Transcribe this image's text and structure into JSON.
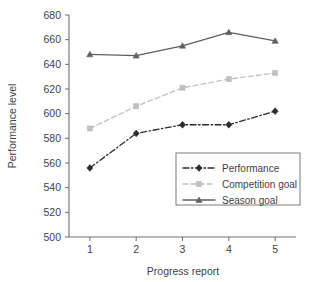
{
  "chart_data": {
    "type": "line",
    "title": "",
    "xlabel": "Progress report",
    "ylabel": "Performance level",
    "categories": [
      "1",
      "2",
      "3",
      "4",
      "5"
    ],
    "x": [
      1,
      2,
      3,
      4,
      5
    ],
    "xlim": [
      0.55,
      5.45
    ],
    "ylim": [
      500,
      680
    ],
    "ytick_labels": [
      "500",
      "520",
      "540",
      "560",
      "580",
      "600",
      "620",
      "640",
      "660",
      "680"
    ],
    "yticks": [
      500,
      520,
      540,
      560,
      580,
      600,
      620,
      640,
      660,
      680
    ],
    "ytick_step": 20,
    "grid": false,
    "legend_position": "lower right inside plot area",
    "series": [
      {
        "name": "Performance",
        "values": [
          556,
          584,
          591,
          591,
          602
        ],
        "color": "#2b2b2b",
        "line_style": "dash-dot",
        "marker": "diamond"
      },
      {
        "name": "Competition goal",
        "values": [
          588,
          606,
          621,
          628,
          633
        ],
        "color": "#c0c0c0",
        "line_style": "dashed",
        "marker": "square"
      },
      {
        "name": "Season goal",
        "values": [
          648,
          647,
          655,
          666,
          659
        ],
        "color": "#5f5f5f",
        "line_style": "solid",
        "marker": "triangle"
      }
    ]
  },
  "axes": {
    "y_title": "Performance level",
    "x_title": "Progress report"
  },
  "legend": {
    "items": [
      {
        "label": "Performance"
      },
      {
        "label": "Competition goal"
      },
      {
        "label": "Season goal"
      }
    ]
  }
}
